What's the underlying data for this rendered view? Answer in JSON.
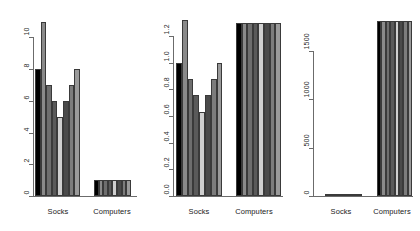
{
  "figure": {
    "background": "#ffffff",
    "panel_count": 3,
    "bar_border_color": "#3a3a3a",
    "axis_color": "#6b6b6b",
    "fill_shades": [
      "#000000",
      "#8a8a8a",
      "#6e6e6e",
      "#5a5a5a",
      "#cfcfcf",
      "#4a4a4a",
      "#7c7c7c",
      "#9a9a9a"
    ]
  },
  "chart_data": [
    {
      "type": "bar",
      "title": "",
      "xlabel": "",
      "ylabel": "",
      "categories": [
        "Socks",
        "Computers"
      ],
      "yticks": [
        0,
        2,
        4,
        6,
        8,
        10
      ],
      "ytick_labels": [
        "0",
        "2",
        "4",
        "6",
        "8",
        "10"
      ],
      "ylim": [
        0,
        11.6
      ],
      "grid": false,
      "legend": "none",
      "series": [
        {
          "name": "bar1",
          "values": [
            8,
            1
          ]
        },
        {
          "name": "bar2",
          "values": [
            11,
            1
          ]
        },
        {
          "name": "bar3",
          "values": [
            7,
            1
          ]
        },
        {
          "name": "bar4",
          "values": [
            6,
            1
          ]
        },
        {
          "name": "bar5",
          "values": [
            5,
            1
          ]
        },
        {
          "name": "bar6",
          "values": [
            6,
            1
          ]
        },
        {
          "name": "bar7",
          "values": [
            7,
            1
          ]
        },
        {
          "name": "bar8",
          "values": [
            8,
            1
          ]
        }
      ]
    },
    {
      "type": "bar",
      "title": "",
      "xlabel": "",
      "ylabel": "",
      "categories": [
        "Socks",
        "Computers"
      ],
      "yticks": [
        0.0,
        0.2,
        0.4,
        0.6,
        0.8,
        1.0,
        1.2
      ],
      "ytick_labels": [
        "0.0",
        "0.2",
        "0.4",
        "0.6",
        "0.8",
        "1.0",
        "1.2"
      ],
      "ylim": [
        0,
        1.38
      ],
      "grid": false,
      "legend": "none",
      "series": [
        {
          "name": "bar1",
          "values": [
            1.0,
            1.3
          ]
        },
        {
          "name": "bar2",
          "values": [
            1.32,
            1.3
          ]
        },
        {
          "name": "bar3",
          "values": [
            0.88,
            1.3
          ]
        },
        {
          "name": "bar4",
          "values": [
            0.76,
            1.3
          ]
        },
        {
          "name": "bar5",
          "values": [
            0.63,
            1.3
          ]
        },
        {
          "name": "bar6",
          "values": [
            0.76,
            1.3
          ]
        },
        {
          "name": "bar7",
          "values": [
            0.88,
            1.3
          ]
        },
        {
          "name": "bar8",
          "values": [
            1.0,
            1.3
          ]
        }
      ]
    },
    {
      "type": "bar",
      "title": "",
      "xlabel": "",
      "ylabel": "",
      "categories": [
        "Socks",
        "Computers"
      ],
      "yticks": [
        0,
        500,
        1000,
        1500
      ],
      "ytick_labels": [
        "0",
        "500",
        "1000",
        "1500"
      ],
      "ylim": [
        0,
        1900
      ],
      "grid": false,
      "legend": "none",
      "series": [
        {
          "name": "bar1",
          "values": [
            4,
            1810
          ]
        },
        {
          "name": "bar2",
          "values": [
            4,
            1810
          ]
        },
        {
          "name": "bar3",
          "values": [
            4,
            1810
          ]
        },
        {
          "name": "bar4",
          "values": [
            4,
            1810
          ]
        },
        {
          "name": "bar5",
          "values": [
            4,
            1810
          ]
        },
        {
          "name": "bar6",
          "values": [
            4,
            1810
          ]
        },
        {
          "name": "bar7",
          "values": [
            4,
            1810
          ]
        },
        {
          "name": "bar8",
          "values": [
            4,
            1810
          ]
        }
      ]
    }
  ],
  "panels": [
    {
      "index": 0,
      "axis": {
        "x": 33,
        "y_top": 28,
        "y_bottom": 196
      },
      "baseline": {
        "x": 33,
        "width": 104,
        "y": 196
      },
      "groups": [
        {
          "label": "Socks",
          "center": 58,
          "bar_x": 35,
          "bar_w": 5.6
        },
        {
          "label": "Computers",
          "center": 112,
          "bar_x": 94,
          "bar_w": 4.6
        }
      ],
      "label_y": 207
    },
    {
      "index": 1,
      "axis": {
        "x": 173,
        "y_top": 22,
        "y_bottom": 196
      },
      "baseline": {
        "x": 173,
        "width": 110,
        "y": 196
      },
      "groups": [
        {
          "label": "Socks",
          "center": 199,
          "bar_x": 176,
          "bar_w": 5.8
        },
        {
          "label": "Computers",
          "center": 254,
          "bar_x": 236,
          "bar_w": 5.6
        }
      ],
      "label_y": 207
    },
    {
      "index": 2,
      "axis": {
        "x": 313,
        "y_top": 51,
        "y_bottom": 196
      },
      "baseline": {
        "x": 313,
        "width": 100,
        "y": 196
      },
      "groups": [
        {
          "label": "Socks",
          "center": 341,
          "bar_x": 325,
          "bar_w": 4.6
        },
        {
          "label": "Computers",
          "center": 392,
          "bar_x": 377,
          "bar_w": 4.4
        }
      ],
      "label_y": 207
    }
  ]
}
